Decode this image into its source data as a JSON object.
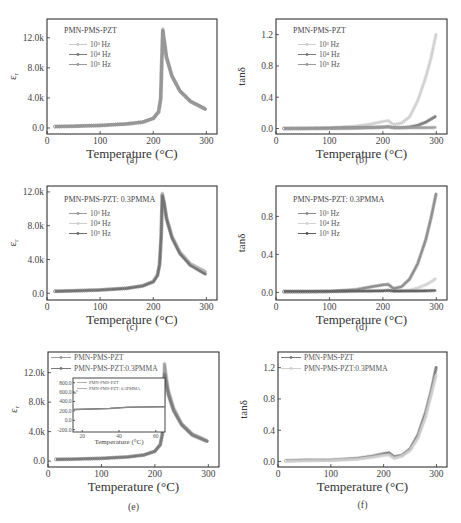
{
  "figure": {
    "panels": [
      "a",
      "b",
      "c",
      "d",
      "e",
      "f"
    ]
  },
  "chart_data": [
    {
      "id": "a",
      "type": "line",
      "caption": "(a)",
      "annotation": "PMN-PMS-PZT",
      "xlabel": "Temperature (°C)",
      "ylabel": "ε_r",
      "xlim": [
        0,
        320
      ],
      "ylim": [
        -800,
        14500
      ],
      "xticks": [
        "0",
        "100",
        "200",
        "300"
      ],
      "yticks": [
        "0.0",
        "4.0k",
        "8.0k",
        "12.0k"
      ],
      "legend_position": "upper left",
      "x": [
        15,
        50,
        100,
        150,
        180,
        200,
        210,
        214,
        216,
        218,
        220,
        225,
        235,
        250,
        270,
        300
      ],
      "series": [
        {
          "name": "10³ Hz",
          "color": "#c8c8c8",
          "values": [
            200,
            250,
            350,
            550,
            800,
            1300,
            2200,
            4000,
            9000,
            13200,
            12000,
            9500,
            7000,
            5000,
            3600,
            2500
          ]
        },
        {
          "name": "10⁴ Hz",
          "color": "#7a7a7a",
          "values": [
            190,
            240,
            340,
            540,
            780,
            1280,
            2150,
            3900,
            8800,
            13000,
            11900,
            9400,
            6950,
            4950,
            3550,
            2450
          ]
        },
        {
          "name": "10⁵ Hz",
          "color": "#9a9a9a",
          "values": [
            180,
            230,
            330,
            530,
            770,
            1260,
            2100,
            3800,
            8600,
            12800,
            11800,
            9300,
            6900,
            4900,
            3500,
            2400
          ]
        }
      ]
    },
    {
      "id": "b",
      "type": "line",
      "caption": "(b)",
      "annotation": "PMN-PMS-PZT",
      "xlabel": "Temperature (°C)",
      "ylabel": "tanδ",
      "xlim": [
        0,
        320
      ],
      "ylim": [
        -0.07,
        1.4
      ],
      "xticks": [
        "0",
        "100",
        "200",
        "300"
      ],
      "yticks": [
        "0.0",
        "0.4",
        "0.8",
        "1.2"
      ],
      "legend_position": "upper left",
      "x": [
        15,
        50,
        100,
        150,
        180,
        200,
        210,
        220,
        235,
        250,
        265,
        280,
        290,
        300
      ],
      "series": [
        {
          "name": "10³ Hz",
          "color": "#cfcfcf",
          "values": [
            0.0,
            0.005,
            0.01,
            0.03,
            0.06,
            0.09,
            0.1,
            0.05,
            0.07,
            0.15,
            0.35,
            0.65,
            0.9,
            1.22
          ]
        },
        {
          "name": "10⁴ Hz",
          "color": "#7a7a7a",
          "values": [
            0.0,
            0.0,
            0.005,
            0.01,
            0.015,
            0.02,
            0.025,
            0.01,
            0.01,
            0.02,
            0.04,
            0.08,
            0.12,
            0.16
          ]
        },
        {
          "name": "10⁵ Hz",
          "color": "#9a9a9a",
          "values": [
            0.0,
            0.0,
            0.0,
            0.005,
            0.01,
            0.015,
            0.02,
            0.01,
            0.01,
            0.01,
            0.01,
            0.01,
            0.012,
            0.015
          ]
        }
      ]
    },
    {
      "id": "c",
      "type": "line",
      "caption": "(c)",
      "annotation": "PMN-PMS-PZT: 0.3PMMA",
      "xlabel": "Temperature (°C)",
      "ylabel": "ε_r",
      "xlim": [
        0,
        320
      ],
      "ylim": [
        -800,
        12700
      ],
      "xticks": [
        "0",
        "100",
        "200",
        "300"
      ],
      "yticks": [
        "0.0",
        "4.0k",
        "8.0k",
        "12.0k"
      ],
      "legend_position": "upper left",
      "x": [
        15,
        50,
        100,
        150,
        180,
        200,
        208,
        212,
        215,
        217,
        220,
        225,
        235,
        250,
        270,
        300
      ],
      "series": [
        {
          "name": "10³ Hz",
          "color": "#9a9a9a",
          "values": [
            250,
            300,
            400,
            600,
            900,
            1400,
            2200,
            3500,
            7000,
            11800,
            11000,
            9000,
            6800,
            4900,
            3500,
            2500
          ]
        },
        {
          "name": "10⁴ Hz",
          "color": "#cfcfcf",
          "values": [
            240,
            290,
            390,
            590,
            880,
            1380,
            2150,
            3450,
            6900,
            11700,
            10900,
            8900,
            6700,
            4800,
            3400,
            2350
          ]
        },
        {
          "name": "10⁵ Hz",
          "color": "#6f6f6f",
          "values": [
            230,
            280,
            380,
            580,
            860,
            1350,
            2100,
            3400,
            6800,
            11600,
            10800,
            8800,
            6600,
            4700,
            3300,
            2200
          ]
        }
      ]
    },
    {
      "id": "d",
      "type": "line",
      "caption": "(d)",
      "annotation": "PMN-PMS-PZT: 0.3PMMA",
      "xlabel": "Temperature (°C)",
      "ylabel": "tanδ",
      "xlim": [
        0,
        320
      ],
      "ylim": [
        -0.08,
        1.12
      ],
      "xticks": [
        "0",
        "100",
        "200",
        "300"
      ],
      "yticks": [
        "0.0",
        "0.4",
        "0.8"
      ],
      "legend_position": "upper left",
      "x": [
        15,
        50,
        100,
        150,
        180,
        200,
        210,
        220,
        235,
        250,
        265,
        280,
        290,
        300
      ],
      "series": [
        {
          "name": "10³ Hz",
          "color": "#8a8a8a",
          "values": [
            0.005,
            0.005,
            0.01,
            0.03,
            0.06,
            0.08,
            0.085,
            0.04,
            0.06,
            0.14,
            0.3,
            0.55,
            0.78,
            1.05
          ]
        },
        {
          "name": "10⁴ Hz",
          "color": "#d2d2d2",
          "values": [
            0.0,
            0.0,
            0.005,
            0.01,
            0.015,
            0.02,
            0.025,
            0.01,
            0.015,
            0.025,
            0.045,
            0.08,
            0.11,
            0.15
          ]
        },
        {
          "name": "10⁵ Hz",
          "color": "#5e5e5e",
          "values": [
            0.01,
            0.01,
            0.012,
            0.015,
            0.015,
            0.017,
            0.02,
            0.015,
            0.015,
            0.015,
            0.015,
            0.017,
            0.018,
            0.02
          ]
        }
      ]
    },
    {
      "id": "e",
      "type": "line",
      "caption": "(e)",
      "xlabel": "Temperature (°C)",
      "ylabel": "ε_r",
      "xlim": [
        0,
        320
      ],
      "ylim": [
        -800,
        14800
      ],
      "xticks": [
        "0",
        "100",
        "200",
        "300"
      ],
      "yticks": [
        "0.0",
        "4.0k",
        "8.0k",
        "12.0k"
      ],
      "legend_position": "upper left",
      "x": [
        15,
        50,
        100,
        150,
        180,
        200,
        210,
        214,
        216,
        218,
        220,
        225,
        235,
        250,
        270,
        300
      ],
      "series": [
        {
          "name": "PMN-PMS-PZT",
          "color": "#9a9a9a",
          "values": [
            220,
            260,
            360,
            560,
            820,
            1320,
            2250,
            4000,
            9000,
            13200,
            12100,
            9700,
            7200,
            5100,
            3700,
            2700
          ]
        },
        {
          "name": "PMN-PMS-PZT:0.3PMMA",
          "color": "#7a7a7a",
          "values": [
            240,
            280,
            380,
            580,
            860,
            1350,
            2200,
            3500,
            7000,
            11800,
            11000,
            9000,
            6800,
            4900,
            3500,
            2600
          ]
        }
      ],
      "inset": {
        "xlabel": "Temperature (°C)",
        "ylabel": "ε_r",
        "xlim": [
          15,
          65
        ],
        "ylim": [
          -250,
          900
        ],
        "xticks": [
          "20",
          "40",
          "60"
        ],
        "yticks": [
          "-200.0",
          "0.0",
          "200.0",
          "400.0",
          "600.0",
          "800.0"
        ],
        "legend": [
          "PMN-PMS-PZT",
          "PMN-PMS-PZT: 0.3PMMA"
        ],
        "x": [
          15,
          25,
          35,
          45,
          55,
          65
        ],
        "series": [
          {
            "name": "PMN-PMS-PZT",
            "values": [
              230,
              240,
              255,
              280,
              285,
              290
            ]
          },
          {
            "name": "PMN-PMS-PZT: 0.3PMMA",
            "values": [
              225,
              235,
              250,
              275,
              280,
              285
            ]
          }
        ]
      }
    },
    {
      "id": "f",
      "type": "line",
      "caption": "(f)",
      "xlabel": "Temperature (°C)",
      "ylabel": "tanδ",
      "xlim": [
        0,
        320
      ],
      "ylim": [
        -0.07,
        1.4
      ],
      "xticks": [
        "0",
        "100",
        "200",
        "300"
      ],
      "yticks": [
        "0.0",
        "0.4",
        "0.8",
        "1.2"
      ],
      "legend_position": "upper left",
      "x": [
        15,
        50,
        100,
        150,
        180,
        200,
        210,
        220,
        235,
        250,
        265,
        280,
        290,
        300
      ],
      "series": [
        {
          "name": "PMN-PMS-PZT",
          "color": "#7a7a7a",
          "values": [
            0.01,
            0.02,
            0.02,
            0.04,
            0.07,
            0.1,
            0.11,
            0.06,
            0.08,
            0.16,
            0.34,
            0.64,
            0.9,
            1.22
          ]
        },
        {
          "name": "PMN-PMS-PZT:0.3PMMA",
          "color": "#cfcfcf",
          "values": [
            0.005,
            0.01,
            0.015,
            0.03,
            0.055,
            0.08,
            0.085,
            0.04,
            0.07,
            0.14,
            0.3,
            0.58,
            0.85,
            1.12
          ]
        }
      ]
    }
  ]
}
